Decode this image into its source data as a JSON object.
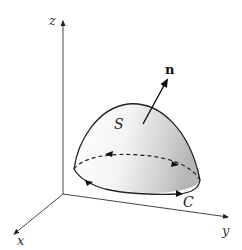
{
  "figure": {
    "axes": {
      "z_label": "z",
      "x_label": "x",
      "y_label": "y"
    },
    "labels": {
      "surface": "S",
      "curve": "C",
      "normal": "n"
    },
    "colors": {
      "line": "#222222",
      "axis": "#444444",
      "surface_light": "#ffffff",
      "surface_dark": "#b8b8b8",
      "background": "#ffffff"
    }
  }
}
